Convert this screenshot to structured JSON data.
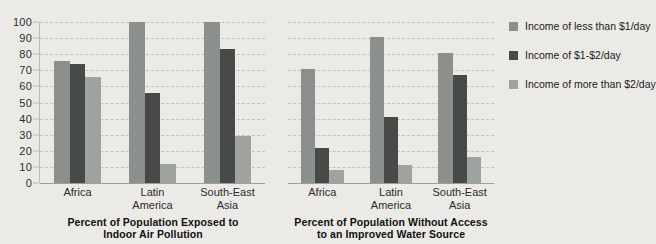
{
  "chart_data": {
    "type": "bar",
    "title": "",
    "subtitle": "",
    "xlabel": "",
    "ylabel": "",
    "ylim": [
      0,
      100
    ],
    "ytick_step": 10,
    "ytick_labels": [
      "100",
      "90",
      "80",
      "70",
      "60",
      "50",
      "40",
      "30",
      "20",
      "10",
      "0"
    ],
    "grid": true,
    "grid_style": "dashed-horizontal",
    "legend_position": "right",
    "categories": [
      "Africa",
      "Latin America",
      "South-East Asia"
    ],
    "series_names": [
      "Income of less than $1/day",
      "Income of $1-$2/day",
      "Income of more than $2/day"
    ],
    "series_colors": [
      "#8c908c",
      "#484a48",
      "#9fa39f"
    ],
    "panels": [
      {
        "caption_lines": [
          "Percent of Population Exposed to",
          "Indoor Air Pollution"
        ],
        "caption": "Percent of Population Exposed to Indoor Air Pollution",
        "categories": [
          "Africa",
          "Latin America",
          "South-East Asia"
        ],
        "category_lines": [
          [
            "Africa"
          ],
          [
            "Latin",
            "America"
          ],
          [
            "South-East",
            "Asia"
          ]
        ],
        "series": [
          {
            "name": "Income of less than $1/day",
            "values": [
              76,
              100,
              100
            ]
          },
          {
            "name": "Income of $1-$2/day",
            "values": [
              74,
              56,
              83
            ]
          },
          {
            "name": "Income of more than $2/day",
            "values": [
              66,
              12,
              29
            ]
          }
        ]
      },
      {
        "caption_lines": [
          "Percent of Population Without Access",
          "to an Improved Water Source"
        ],
        "caption": "Percent of Population Without Access to an Improved Water Source",
        "categories": [
          "Africa",
          "Latin America",
          "South-East Asia"
        ],
        "category_lines": [
          [
            "Africa"
          ],
          [
            "Latin",
            "America"
          ],
          [
            "South-East",
            "Asia"
          ]
        ],
        "series": [
          {
            "name": "Income of less than $1/day",
            "values": [
              71,
              91,
              81
            ]
          },
          {
            "name": "Income of $1-$2/day",
            "values": [
              22,
              41,
              67
            ]
          },
          {
            "name": "Income of more than $2/day",
            "values": [
              8,
              11,
              16
            ]
          }
        ]
      }
    ]
  },
  "legend": {
    "items": [
      {
        "label": "Income of less than $1/day",
        "color": "#8c908c"
      },
      {
        "label": "Income of $1-$2/day",
        "color": "#484a48"
      },
      {
        "label": "Income of more than $2/day",
        "color": "#9fa39f"
      }
    ]
  },
  "axis": {
    "y_labels": [
      "100",
      "90",
      "80",
      "70",
      "60",
      "50",
      "40",
      "30",
      "20",
      "10",
      "0"
    ]
  },
  "panel_1": {
    "caption_line_1": "Percent of Population Exposed to",
    "caption_line_2": "Indoor Air Pollution"
  },
  "panel_2": {
    "caption_line_1": "Percent of Population Without Access",
    "caption_line_2": "to an Improved Water Source"
  }
}
